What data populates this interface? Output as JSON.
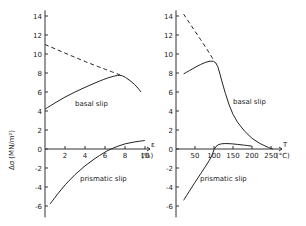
{
  "chart_data": [
    {
      "type": "line",
      "panel": "left",
      "xlabel": "ε (%)",
      "ylabel": "Δσ (MN/m²)",
      "xlim": [
        0,
        10.5
      ],
      "ylim": [
        -7,
        14.5
      ],
      "xticks": [
        2,
        4,
        6,
        8,
        10
      ],
      "xtick_labels": [
        "2",
        "4",
        "6",
        "8",
        "10"
      ],
      "yticks": [
        -6,
        -4,
        -2,
        0,
        2,
        4,
        6,
        8,
        10,
        12,
        14
      ],
      "ytick_labels": [
        "-6",
        "-4",
        "-2",
        "0",
        "2",
        "4",
        "6",
        "8",
        "10",
        "12",
        "14"
      ],
      "x_unit_label": "(%)",
      "x_symbol": "ε",
      "series": [
        {
          "name": "basal slip",
          "style": "solid",
          "x": [
            0,
            2,
            4,
            6,
            7,
            7.5,
            8,
            9,
            9.6
          ],
          "y": [
            4.2,
            5.5,
            6.5,
            7.4,
            7.7,
            7.8,
            7.6,
            6.8,
            6.0
          ]
        },
        {
          "name": "basal slip (extrapolated)",
          "style": "dashed",
          "x": [
            0,
            2,
            4,
            6,
            7.5
          ],
          "y": [
            11.0,
            10.1,
            9.2,
            8.4,
            7.8
          ]
        },
        {
          "name": "prismatic slip",
          "style": "solid",
          "x": [
            0.5,
            2,
            4,
            6,
            6.6,
            8,
            10
          ],
          "y": [
            -5.8,
            -3.7,
            -1.7,
            -0.3,
            0.0,
            0.6,
            0.9
          ]
        }
      ],
      "annotations": [
        "basal slip",
        "prismatic slip"
      ]
    },
    {
      "type": "line",
      "panel": "right",
      "xlabel": "T (°C)",
      "ylabel": "Δσ (MN/m²)",
      "xlim": [
        0,
        270
      ],
      "ylim": [
        -7,
        14.5
      ],
      "xticks": [
        50,
        100,
        150,
        200,
        250
      ],
      "xtick_labels": [
        "50",
        "100",
        "150",
        "200",
        "250"
      ],
      "yticks": [
        -6,
        -4,
        -2,
        0,
        2,
        4,
        6,
        8,
        10,
        12,
        14
      ],
      "ytick_labels": [
        "-6",
        "-4",
        "-2",
        "0",
        "2",
        "4",
        "6",
        "8",
        "10",
        "12",
        "14"
      ],
      "x_unit_label": "(°C)",
      "x_symbol": "T",
      "series": [
        {
          "name": "basal slip",
          "style": "solid",
          "x": [
            20,
            50,
            80,
            100,
            110,
            120,
            140,
            160,
            200,
            240,
            255
          ],
          "y": [
            7.9,
            8.6,
            9.2,
            9.3,
            8.8,
            7.2,
            4.5,
            2.8,
            1.0,
            0.2,
            0.0
          ]
        },
        {
          "name": "basal slip (extrapolated)",
          "style": "dashed",
          "x": [
            20,
            50,
            80,
            100
          ],
          "y": [
            14.2,
            12.4,
            10.6,
            9.3
          ]
        },
        {
          "name": "prismatic slip",
          "style": "solid",
          "x": [
            20,
            50,
            80,
            95,
            100,
            110,
            130,
            160,
            200
          ],
          "y": [
            -5.4,
            -3.5,
            -1.7,
            -0.7,
            0.0,
            0.5,
            0.6,
            0.5,
            0.3
          ]
        }
      ],
      "annotations": [
        "basal slip",
        "prismatic slip"
      ]
    }
  ]
}
